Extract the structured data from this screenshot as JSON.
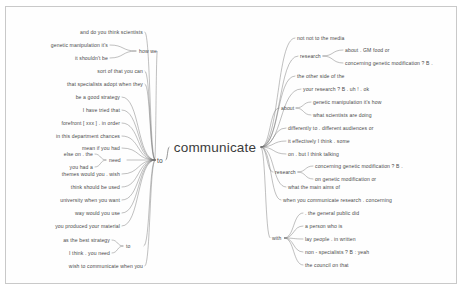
{
  "doc": {
    "type": "mind-map",
    "center": {
      "label": "communicate",
      "x": 215,
      "y": 147
    },
    "colors": {
      "ink": "#4a4a4a",
      "line": "#6f6f6f",
      "border": "#c9c9c9",
      "bg": "#ffffff"
    }
  },
  "left": {
    "groups": [
      {
        "name": "how-we-group",
        "hub": {
          "label": "how we",
          "x": 139,
          "y": 51,
          "align": "l"
        },
        "leaves": [
          {
            "label": "genetic manipulation it's",
            "x": 108,
            "y": 45,
            "align": "r"
          },
          {
            "label": "it shouldn't be",
            "x": 108,
            "y": 58,
            "align": "r"
          }
        ]
      },
      {
        "name": "need-group",
        "hub": {
          "label": "need",
          "x": 109,
          "y": 160,
          "align": "l"
        },
        "leaves": [
          {
            "label": "else on . the",
            "x": 93,
            "y": 154,
            "align": "r"
          },
          {
            "label": "you had a",
            "x": 93,
            "y": 167,
            "align": "r"
          }
        ]
      },
      {
        "name": "to-bottom-group",
        "hub": {
          "label": "to",
          "x": 126,
          "y": 246,
          "align": "l"
        },
        "leaves": [
          {
            "label": "as the best strategy",
            "x": 110,
            "y": 240,
            "align": "r"
          },
          {
            "label": "I think . you need",
            "x": 110,
            "y": 253,
            "align": "r"
          }
        ]
      }
    ],
    "hub": {
      "label": "to",
      "x": 157,
      "y": 160,
      "align": "l"
    },
    "direct": [
      {
        "label": "and do you think scientists",
        "x": 143,
        "y": 32,
        "align": "r"
      },
      {
        "label": "sort of that you can",
        "x": 143,
        "y": 71,
        "align": "r"
      },
      {
        "label": "that specialists adopt when they",
        "x": 143,
        "y": 84,
        "align": "r"
      },
      {
        "label": "be a good strategy",
        "x": 120,
        "y": 97,
        "align": "r"
      },
      {
        "label": "I have tried that",
        "x": 120,
        "y": 110,
        "align": "r"
      },
      {
        "label": "forefront [ xxx ] . in order",
        "x": 120,
        "y": 123,
        "align": "r"
      },
      {
        "label": "in this department chances",
        "x": 120,
        "y": 136,
        "align": "r"
      },
      {
        "label": "mean if you had",
        "x": 120,
        "y": 148,
        "align": "r"
      },
      {
        "label": "themes would you . wish",
        "x": 120,
        "y": 174,
        "align": "r"
      },
      {
        "label": "think should be used",
        "x": 120,
        "y": 187,
        "align": "r"
      },
      {
        "label": "university when you want",
        "x": 120,
        "y": 200,
        "align": "r"
      },
      {
        "label": "way would you use",
        "x": 120,
        "y": 213,
        "align": "r"
      },
      {
        "label": "you produced your material",
        "x": 120,
        "y": 226,
        "align": "r"
      },
      {
        "label": "wish to communicate when you",
        "x": 143,
        "y": 266,
        "align": "r"
      }
    ]
  },
  "right": {
    "groups": [
      {
        "name": "research-top-group",
        "hub": {
          "label": "research",
          "x": 300,
          "y": 56,
          "align": "l"
        },
        "leaves": [
          {
            "label": "about . GM food or",
            "x": 345,
            "y": 50,
            "align": "l"
          },
          {
            "label": "concerning genetic modification ? B .",
            "x": 345,
            "y": 63,
            "align": "l"
          }
        ]
      },
      {
        "name": "about-group",
        "hub": {
          "label": "about",
          "x": 281,
          "y": 108,
          "align": "l"
        },
        "leaves": [
          {
            "label": "genetic manipulation it's how",
            "x": 313,
            "y": 102,
            "align": "l"
          },
          {
            "label": "what scientists are doing",
            "x": 313,
            "y": 115,
            "align": "l"
          }
        ]
      },
      {
        "name": "research-mid-group",
        "hub": {
          "label": "research",
          "x": 275,
          "y": 172,
          "align": "l"
        },
        "leaves": [
          {
            "label": "concerning genetic modification ? B .",
            "x": 315,
            "y": 166,
            "align": "l"
          },
          {
            "label": "on genetic modification or",
            "x": 315,
            "y": 179,
            "align": "l"
          }
        ]
      },
      {
        "name": "with-group",
        "hub": {
          "label": "with",
          "x": 272,
          "y": 238,
          "align": "l"
        },
        "leaves": [
          {
            "label": ". the general public did",
            "x": 305,
            "y": 213,
            "align": "l"
          },
          {
            "label": "a person who is",
            "x": 305,
            "y": 226,
            "align": "l"
          },
          {
            "label": "lay people . in written",
            "x": 305,
            "y": 239,
            "align": "l"
          },
          {
            "label": "non - specialists ? B : yeah",
            "x": 305,
            "y": 252,
            "align": "l"
          },
          {
            "label": "the council on that",
            "x": 305,
            "y": 265,
            "align": "l"
          }
        ]
      }
    ],
    "direct": [
      {
        "label": "not not to the media",
        "x": 297,
        "y": 38,
        "align": "l"
      },
      {
        "label": "the other side of the",
        "x": 297,
        "y": 76,
        "align": "l"
      },
      {
        "label": "your research ? B . uh ! . ok",
        "x": 303,
        "y": 89,
        "align": "l"
      },
      {
        "label": "differently to . different audiences or",
        "x": 288,
        "y": 128,
        "align": "l"
      },
      {
        "label": "it effectively I think . some",
        "x": 288,
        "y": 141,
        "align": "l"
      },
      {
        "label": "on . but I think talking",
        "x": 288,
        "y": 154,
        "align": "l"
      },
      {
        "label": "what the main aims of",
        "x": 288,
        "y": 187,
        "align": "l"
      },
      {
        "label": "when you communicate research . concerning",
        "x": 283,
        "y": 200,
        "align": "l"
      }
    ]
  }
}
